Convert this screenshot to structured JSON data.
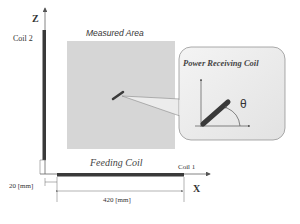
{
  "labels": {
    "z_axis": "Z",
    "x_axis": "X",
    "coil2": "Coil 2",
    "coil1": "Coil 1",
    "measured_area": "Measured Area",
    "power_receiving_coil": "Power Receiving Coil",
    "theta": "θ",
    "feeding_coil": "Feeding Coil",
    "gap_dimension": "20 [mm]",
    "length_dimension": "420 [mm]"
  },
  "colors": {
    "coil": "#3a3a3a",
    "measured_area_fill": "#d6d6d6",
    "callout_fill": "#ececec",
    "axis": "#555555"
  }
}
